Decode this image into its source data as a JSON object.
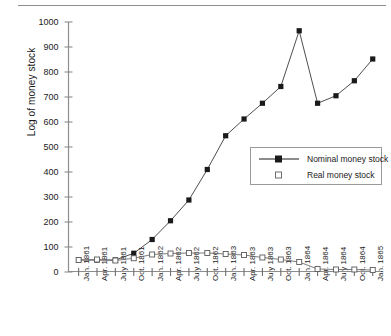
{
  "axis": {
    "ylabel": "Log of money stock",
    "yticks": [
      "0",
      "100",
      "200",
      "300",
      "400",
      "500",
      "600",
      "700",
      "800",
      "900",
      "1000"
    ]
  },
  "legend": {
    "items": [
      {
        "label": "Nominal money stock",
        "marker": "filled-square",
        "color": "#1a1a1a"
      },
      {
        "label": "Real money stock",
        "marker": "open-square",
        "color": "#1a1a1a"
      }
    ]
  },
  "chart_data": {
    "type": "line",
    "title": "",
    "xlabel": "",
    "ylabel": "Log of money stock",
    "ylim": [
      0,
      1000
    ],
    "ytick_step": 100,
    "grid": false,
    "legend_position": "right-middle",
    "categories": [
      "Jan. 1861",
      "Apr. 1861",
      "July 1861",
      "Oct. 1861",
      "Jan. 1862",
      "Apr. 1862",
      "July 1862",
      "Oct. 1862",
      "Jan. 1863",
      "Apr. 1863",
      "July 1863",
      "Oct. 1863",
      "Jan. 1864",
      "Apr. 1864",
      "July 1864",
      "Oct. 1864",
      "Jan. 1865"
    ],
    "series": [
      {
        "name": "Nominal money stock",
        "marker": "filled-square",
        "color": "#1a1a1a",
        "values": [
          48,
          48,
          48,
          75,
          130,
          205,
          288,
          410,
          545,
          612,
          675,
          742,
          965,
          675,
          705,
          765,
          852
        ]
      },
      {
        "name": "Real money stock",
        "marker": "open-square",
        "color": "#1a1a1a",
        "values": [
          48,
          50,
          46,
          55,
          70,
          74,
          76,
          76,
          72,
          68,
          58,
          50,
          40,
          12,
          10,
          10,
          8
        ]
      }
    ]
  }
}
